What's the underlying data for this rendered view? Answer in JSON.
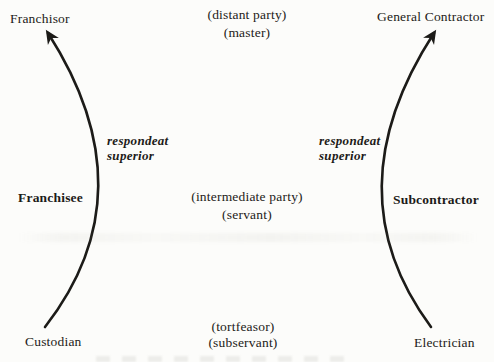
{
  "diagram": {
    "title_concept": "respondeat superior liability chains",
    "left_chain": {
      "top": "Franchisor",
      "middle": "Franchisee",
      "bottom": "Custodian",
      "arrow_label_line1": "respondeat",
      "arrow_label_line2": "superior"
    },
    "right_chain": {
      "top": "General Contractor",
      "middle": "Subcontractor",
      "bottom": "Electrician",
      "arrow_label_line1": "respondeat",
      "arrow_label_line2": "superior"
    },
    "center_roles": {
      "top_line1": "(distant party)",
      "top_line2": "(master)",
      "middle_line1": "(intermediate party)",
      "middle_line2": "(servant)",
      "bottom_line1": "(tortfeasor)",
      "bottom_line2": "(subservant)"
    },
    "colors": {
      "ink": "#1c1b18",
      "paper": "#fcfcfa"
    }
  }
}
